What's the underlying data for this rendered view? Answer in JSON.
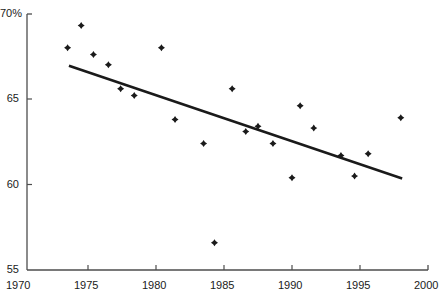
{
  "chart_data": {
    "type": "scatter",
    "title": "",
    "subtitle": "",
    "xlabel": "",
    "ylabel": "",
    "xlim": [
      1970,
      2000
    ],
    "ylim": [
      55,
      70
    ],
    "grid": false,
    "legend": null,
    "x_ticks": [
      1970,
      1975,
      1980,
      1985,
      1990,
      1995,
      2000
    ],
    "x_tick_labels": [
      "1970",
      "1975",
      "1980",
      "1985",
      "1990",
      "1995",
      "2000"
    ],
    "y_ticks": [
      55,
      60,
      65,
      70
    ],
    "y_tick_labels": [
      "55",
      "60",
      "65",
      "70%"
    ],
    "marker": "diamond",
    "marker_color": "#1a1a1a",
    "marker_size": 7,
    "series": [
      {
        "name": "observations",
        "type": "scatter",
        "points": [
          {
            "x": 1973.5,
            "y": 68.0
          },
          {
            "x": 1974.5,
            "y": 69.3
          },
          {
            "x": 1975.4,
            "y": 67.6
          },
          {
            "x": 1976.5,
            "y": 67.0
          },
          {
            "x": 1977.4,
            "y": 65.6
          },
          {
            "x": 1978.4,
            "y": 65.2
          },
          {
            "x": 1980.4,
            "y": 68.0
          },
          {
            "x": 1981.4,
            "y": 63.8
          },
          {
            "x": 1983.5,
            "y": 62.4
          },
          {
            "x": 1984.3,
            "y": 56.6
          },
          {
            "x": 1985.6,
            "y": 65.6
          },
          {
            "x": 1986.6,
            "y": 63.1
          },
          {
            "x": 1987.5,
            "y": 63.4
          },
          {
            "x": 1988.6,
            "y": 62.4
          },
          {
            "x": 1990.0,
            "y": 60.4
          },
          {
            "x": 1990.6,
            "y": 64.6
          },
          {
            "x": 1991.6,
            "y": 63.3
          },
          {
            "x": 1993.6,
            "y": 61.7
          },
          {
            "x": 1994.6,
            "y": 60.5
          },
          {
            "x": 1995.6,
            "y": 61.8
          },
          {
            "x": 1998.0,
            "y": 63.9
          }
        ]
      },
      {
        "name": "trend-line",
        "type": "line",
        "color": "#1a1a1a",
        "width": 2.6,
        "endpoints": [
          {
            "x": 1973.6,
            "y": 66.95
          },
          {
            "x": 1998.1,
            "y": 60.35
          }
        ]
      }
    ]
  },
  "axes": {
    "x_axis_color": "#4d4d4d",
    "y_axis_color": "#4d4d4d",
    "tick_length": 4
  }
}
